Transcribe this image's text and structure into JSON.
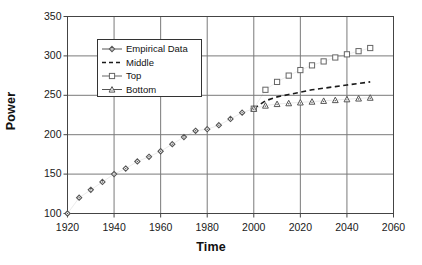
{
  "chart_data": {
    "type": "scatter",
    "title": "",
    "xlabel": "Time",
    "ylabel": "Power",
    "xlim": [
      1920,
      2060
    ],
    "ylim": [
      100,
      350
    ],
    "xticks": [
      1920,
      1940,
      1960,
      1980,
      2000,
      2020,
      2040,
      2060
    ],
    "yticks": [
      100,
      150,
      200,
      250,
      300,
      350
    ],
    "grid": true,
    "legend_position": "upper-left-inside",
    "series": [
      {
        "name": "Empirical Data",
        "marker": "diamond",
        "linestyle": "solid",
        "color": "#555555",
        "x": [
          1920,
          1925,
          1930,
          1935,
          1940,
          1945,
          1950,
          1955,
          1960,
          1965,
          1970,
          1975,
          1980,
          1985,
          1990,
          1995,
          2000
        ],
        "y": [
          100,
          120,
          130,
          140,
          150,
          157,
          166,
          172,
          179,
          188,
          197,
          205,
          207,
          212,
          220,
          228,
          233
        ]
      },
      {
        "name": "Middle",
        "marker": "none",
        "linestyle": "dashed",
        "color": "#1a1a1a",
        "x": [
          2000,
          2005,
          2010,
          2015,
          2020,
          2025,
          2030,
          2035,
          2040,
          2045,
          2050
        ],
        "y": [
          233,
          243,
          248,
          251,
          254,
          257,
          259,
          261,
          263,
          265,
          267
        ]
      },
      {
        "name": "Top",
        "marker": "square-open",
        "linestyle": "solid",
        "color": "#666666",
        "x": [
          2000,
          2005,
          2010,
          2015,
          2020,
          2025,
          2030,
          2035,
          2040,
          2045,
          2050
        ],
        "y": [
          233,
          257,
          267,
          275,
          282,
          288,
          293,
          298,
          302,
          306,
          310
        ]
      },
      {
        "name": "Bottom",
        "marker": "triangle",
        "linestyle": "solid",
        "color": "#555555",
        "x": [
          2000,
          2005,
          2010,
          2015,
          2020,
          2025,
          2030,
          2035,
          2040,
          2045,
          2050
        ],
        "y": [
          233,
          237,
          239,
          240,
          241,
          242,
          243,
          244,
          245,
          246,
          247
        ]
      }
    ]
  },
  "legend": {
    "entries": [
      {
        "label": "Empirical Data"
      },
      {
        "label": "Middle"
      },
      {
        "label": "Top"
      },
      {
        "label": "Bottom"
      }
    ]
  },
  "axes": {
    "x_title": "Time",
    "y_title": "Power"
  }
}
